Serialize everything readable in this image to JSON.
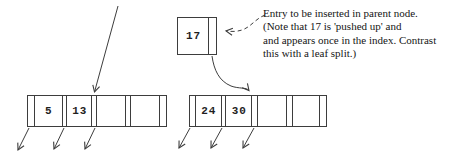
{
  "annotation": {
    "lines": [
      "Entry to be inserted in parent node.",
      "(Note that 17 is 'pushed up' and",
      "and appears once in the index. Contrast",
      "this with a leaf split.)"
    ]
  },
  "entry_box": {
    "key": "17"
  },
  "left_node": {
    "keys": [
      "5",
      "13",
      "",
      ""
    ]
  },
  "right_node": {
    "keys": [
      "24",
      "30",
      "",
      ""
    ]
  },
  "icons": {
    "arrows": [
      "parent-pointer-arrow",
      "push-up-arrow",
      "annotation-dashed-arrow",
      "child-pointer-arrows"
    ]
  },
  "colors": {
    "background": "#ffffff",
    "line": "#3d3d3d",
    "text": "#151515"
  }
}
